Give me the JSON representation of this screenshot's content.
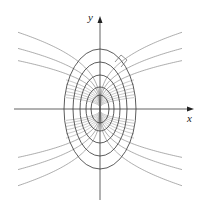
{
  "figure": {
    "x_label": "x",
    "y_label": "y",
    "origin_px": [
      100,
      109
    ],
    "colors": {
      "axis": "#3a3a3a",
      "ellipse": "#4a4a4a",
      "trajectory": "#8a8a8a"
    },
    "ellipses": [
      {
        "a": 36,
        "b": 60
      },
      {
        "a": 27,
        "b": 47
      },
      {
        "a": 20,
        "b": 34
      },
      {
        "a": 14,
        "b": 22
      },
      {
        "a": 9,
        "b": 14
      }
    ],
    "trajectory_exponent": 0.36,
    "trajectories_C": [
      15.7,
      12.4,
      9.9
    ],
    "fan_C": [
      8.2,
      7.0,
      5.9,
      4.9,
      4.0,
      3.2
    ],
    "trajectory_x_extent": 82,
    "right_angle_marker": true
  }
}
